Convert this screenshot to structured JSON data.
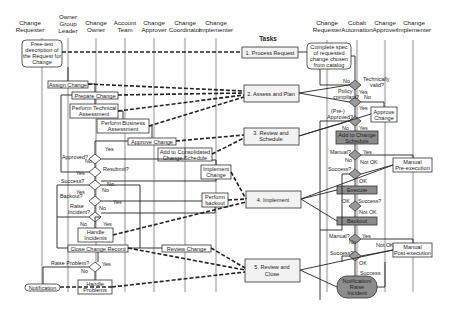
{
  "diagram": {
    "left_lanes": [
      "Change Requester",
      "Owner Group Leader",
      "Change Owner",
      "Account Team",
      "Change Approver",
      "Change Coordinator",
      "Change Implementer"
    ],
    "left_lanes_lines": [
      [
        "Change",
        "Requester"
      ],
      [
        "Owner",
        "Group",
        "Leader"
      ],
      [
        "Change",
        "Owner"
      ],
      [
        "Account",
        "Team"
      ],
      [
        "Change",
        "Approver"
      ],
      [
        "Change",
        "Coordinator"
      ],
      [
        "Change",
        "Implementer"
      ]
    ],
    "tasks_title": "Tasks",
    "right_lanes": [
      "Change Requester",
      "Cobalt Automation",
      "Change Approver",
      "Change Implementer"
    ],
    "right_lanes_lines": [
      [
        "Change",
        "Requester"
      ],
      [
        "Cobalt",
        "Automation"
      ],
      [
        "Change",
        "Approver"
      ],
      [
        "Change",
        "Implementer"
      ]
    ],
    "tasks": [
      {
        "id": "t1",
        "lines": [
          "1. Process Request"
        ]
      },
      {
        "id": "t2",
        "lines": [
          "2. Assess and Plan"
        ]
      },
      {
        "id": "t3",
        "lines": [
          "3. Review and",
          "Schedule"
        ]
      },
      {
        "id": "t4",
        "lines": [
          "4. Implement"
        ]
      },
      {
        "id": "t5",
        "lines": [
          "5. Review and",
          "Close"
        ]
      }
    ],
    "left_nodes": {
      "free_text": [
        "Free-text",
        "description of",
        "the Request for",
        "Change"
      ],
      "assign_change": "Assign Change",
      "prepare_change": "Prepare Change",
      "perform_tech": [
        "Perform Technical",
        "Assessment"
      ],
      "perform_business": [
        "Perform Business",
        "Assessment"
      ],
      "approve_change": "Approve Change",
      "add_consolidated": [
        "Add to Consolidated",
        "Change Schedule"
      ],
      "implement_change": [
        "Implement",
        "Change"
      ],
      "perform_backout": [
        "Perform",
        "backout"
      ],
      "handle_incidents": [
        "Handle",
        "Incidents"
      ],
      "close_change_record": "Close Change Record",
      "review_change": "Review Change",
      "handle_problems": [
        "Handle",
        "Problems"
      ],
      "notification": "Notification"
    },
    "left_decisions": {
      "approved": "Approved?",
      "resubmit": "Resubmit?",
      "success": "Success?",
      "backout": "Backout?",
      "raise_incident": [
        "Raise",
        "Incident?"
      ],
      "raise_problem": "Raise Problem?"
    },
    "right_nodes": {
      "complete_spec": [
        "Complete spec",
        "of requested",
        "change chosen",
        "from catalog"
      ],
      "approve_change": [
        "Approve",
        "Change"
      ],
      "add_to_change_schedule": [
        "Add to Change",
        "Schedule"
      ],
      "manual_pre": [
        "Manual",
        "Pre-execution"
      ],
      "execute": "Execute",
      "backout": "Backout",
      "manual_post": [
        "Manual",
        "Post-execution"
      ],
      "notification_raise": [
        "Notification/",
        "Raise",
        "Incident"
      ]
    },
    "right_decisions": {
      "tech_valid": [
        "Technically",
        "valid?"
      ],
      "policy": [
        "Policy",
        "compliant?"
      ],
      "pre_approved": [
        "(Pre-)",
        "Approved?"
      ],
      "manual1": "Manual?",
      "success1": "Success?",
      "success2": "Success?",
      "manual2": "Manual?",
      "success3": "Success?"
    },
    "edge_labels": {
      "yes": "Yes",
      "no": "No",
      "ok": "OK",
      "not_ok": "Not OK",
      "success": "Success"
    }
  }
}
